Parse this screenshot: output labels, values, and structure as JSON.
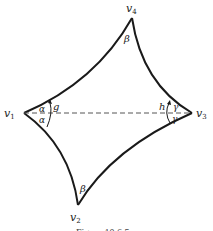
{
  "figure": {
    "caption": "Figure 10.6.5",
    "vertices": [
      {
        "id": "v1",
        "label": "v",
        "sub": "1",
        "x": 24,
        "y": 113
      },
      {
        "id": "v2",
        "label": "v",
        "sub": "2",
        "x": 78,
        "y": 205
      },
      {
        "id": "v3",
        "label": "v",
        "sub": "3",
        "x": 192,
        "y": 113
      },
      {
        "id": "v4",
        "label": "v",
        "sub": "4",
        "x": 132,
        "y": 18
      }
    ],
    "angles": {
      "v1_upper": "α",
      "v1_lower": "α",
      "v2": "β",
      "v3_upper": "γ",
      "v3_lower": "γ",
      "v4": "β"
    },
    "rotations": {
      "at_v1": "g",
      "at_v3": "h"
    },
    "colors": {
      "stroke": "#1a1a1a",
      "dashed": "#555555"
    }
  }
}
